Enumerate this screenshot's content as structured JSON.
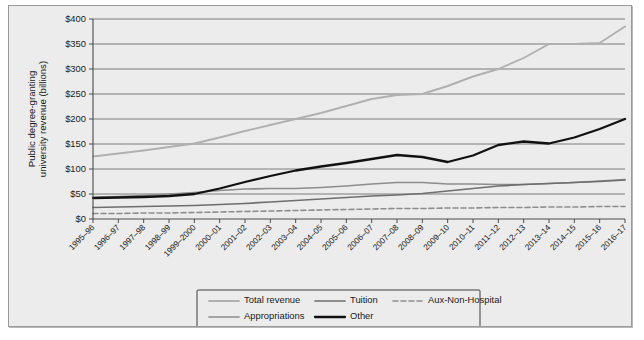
{
  "figure": {
    "background_color": "#ececec",
    "frame_border_color": "#9a9a9a",
    "plot_border_color": "#4a4a4a",
    "gridline_color": "#6f6f6f"
  },
  "chart_data": {
    "type": "line",
    "title": "",
    "xlabel": "",
    "ylabel": "Public degree-granting university revenue (billions)",
    "ylim": [
      0,
      400
    ],
    "ytick_values": [
      0,
      50,
      100,
      150,
      200,
      250,
      300,
      350,
      400
    ],
    "ytick_labels": [
      "$0",
      "$50",
      "$100",
      "$150",
      "$200",
      "$250",
      "$300",
      "$350",
      "$400"
    ],
    "grid": true,
    "legend_position": "below-axes",
    "categories": [
      "1995–96",
      "1996–97",
      "1997–98",
      "1998–99",
      "1999–2000",
      "2000–01",
      "2001–02",
      "2002–03",
      "2003–04",
      "2004–05",
      "2005–06",
      "2006–07",
      "2007–08",
      "2008–09",
      "2009–10",
      "2010–11",
      "2011–12",
      "2012–13",
      "2013–14",
      "2014–15",
      "2015–16",
      "2016–17"
    ],
    "series": [
      {
        "name": "Total revenue",
        "color": "#b0b0b0",
        "width": 1.9,
        "dash": "none",
        "values": [
          125,
          131,
          137,
          144,
          151,
          163,
          176,
          188,
          200,
          212,
          226,
          240,
          248,
          250,
          266,
          285,
          300,
          322,
          350,
          350,
          352,
          385
        ]
      },
      {
        "name": "Appropriations",
        "color": "#8d8d8d",
        "width": 1.7,
        "dash": "none",
        "values": [
          43,
          45,
          47,
          50,
          53,
          57,
          60,
          61,
          61,
          63,
          66,
          70,
          73,
          73,
          70,
          70,
          69,
          69,
          71,
          73,
          76,
          79
        ]
      },
      {
        "name": "Tuition",
        "color": "#6e6e6e",
        "width": 1.7,
        "dash": "none",
        "values": [
          23,
          24,
          25,
          26,
          27,
          29,
          31,
          34,
          37,
          40,
          43,
          46,
          48,
          51,
          56,
          61,
          66,
          69,
          71,
          73,
          75,
          78
        ]
      },
      {
        "name": "Other",
        "color": "#111111",
        "width": 2.3,
        "dash": "none",
        "values": [
          42,
          43,
          44,
          46,
          50,
          61,
          74,
          86,
          97,
          105,
          112,
          120,
          128,
          124,
          114,
          127,
          148,
          155,
          151,
          163,
          180,
          200
        ]
      },
      {
        "name": "Aux-Non-Hospital",
        "color": "#8d8d8d",
        "width": 1.6,
        "dash": "5,3",
        "values": [
          11,
          11,
          12,
          12,
          13,
          14,
          15,
          16,
          17,
          18,
          19,
          20,
          21,
          21,
          22,
          22,
          23,
          23,
          24,
          24,
          25,
          25
        ]
      }
    ]
  },
  "legend": {
    "entries": [
      {
        "label": "Total revenue",
        "color": "#b0b0b0",
        "dash": "none",
        "width": 1.9
      },
      {
        "label": "Tuition",
        "color": "#6e6e6e",
        "dash": "none",
        "width": 1.7
      },
      {
        "label": "Aux-Non-Hospital",
        "color": "#8d8d8d",
        "dash": "5,3",
        "width": 1.6
      },
      {
        "label": "Appropriations",
        "color": "#8d8d8d",
        "dash": "none",
        "width": 1.7
      },
      {
        "label": "Other",
        "color": "#111111",
        "dash": "none",
        "width": 2.3
      }
    ]
  }
}
